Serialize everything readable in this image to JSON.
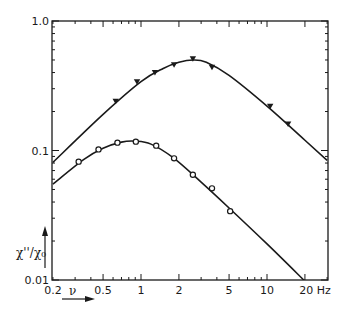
{
  "chart_data": {
    "type": "line",
    "title": "",
    "xlabel": "ν",
    "xunit": "Hz",
    "ylabel": "χ''/χ₀",
    "xscale": "log",
    "yscale": "log",
    "xlim": [
      0.2,
      30
    ],
    "ylim": [
      0.01,
      1.0
    ],
    "grid": false,
    "legend": null,
    "x_ticks": [
      {
        "value": 0.2,
        "label": "0.2"
      },
      {
        "value": 0.5,
        "label": "0.5"
      },
      {
        "value": 1,
        "label": "1"
      },
      {
        "value": 2,
        "label": "2"
      },
      {
        "value": 5,
        "label": "5"
      },
      {
        "value": 10,
        "label": "10"
      },
      {
        "value": 20,
        "label": "20 Hz"
      }
    ],
    "y_ticks": [
      {
        "value": 0.01,
        "label": "0.01"
      },
      {
        "value": 0.1,
        "label": "0.1"
      },
      {
        "value": 1.0,
        "label": "1.0"
      }
    ],
    "series": [
      {
        "name": "upper (filled triangles)",
        "marker": "filled-triangle-down",
        "points": [
          {
            "x": 0.63,
            "y": 0.24
          },
          {
            "x": 0.93,
            "y": 0.34
          },
          {
            "x": 1.29,
            "y": 0.4
          },
          {
            "x": 1.83,
            "y": 0.46
          },
          {
            "x": 2.58,
            "y": 0.51
          },
          {
            "x": 3.66,
            "y": 0.44
          },
          {
            "x": 10.6,
            "y": 0.22
          },
          {
            "x": 14.7,
            "y": 0.16
          }
        ],
        "fit_curve": [
          {
            "x": 0.2,
            "y": 0.081
          },
          {
            "x": 0.5,
            "y": 0.19
          },
          {
            "x": 1.0,
            "y": 0.34
          },
          {
            "x": 1.5,
            "y": 0.43
          },
          {
            "x": 2.0,
            "y": 0.48
          },
          {
            "x": 2.6,
            "y": 0.5
          },
          {
            "x": 3.3,
            "y": 0.48
          },
          {
            "x": 5.0,
            "y": 0.38
          },
          {
            "x": 10,
            "y": 0.22
          },
          {
            "x": 20,
            "y": 0.12
          },
          {
            "x": 30,
            "y": 0.084
          }
        ]
      },
      {
        "name": "lower (open circles)",
        "marker": "open-circle",
        "points": [
          {
            "x": 0.32,
            "y": 0.082
          },
          {
            "x": 0.46,
            "y": 0.102
          },
          {
            "x": 0.65,
            "y": 0.115
          },
          {
            "x": 0.91,
            "y": 0.117
          },
          {
            "x": 1.32,
            "y": 0.109
          },
          {
            "x": 1.83,
            "y": 0.087
          },
          {
            "x": 2.58,
            "y": 0.065
          },
          {
            "x": 3.66,
            "y": 0.051
          },
          {
            "x": 5.1,
            "y": 0.034
          }
        ],
        "fit_curve": [
          {
            "x": 0.2,
            "y": 0.055
          },
          {
            "x": 0.35,
            "y": 0.085
          },
          {
            "x": 0.5,
            "y": 0.104
          },
          {
            "x": 0.7,
            "y": 0.116
          },
          {
            "x": 0.9,
            "y": 0.118
          },
          {
            "x": 1.2,
            "y": 0.112
          },
          {
            "x": 1.8,
            "y": 0.088
          },
          {
            "x": 3.0,
            "y": 0.057
          },
          {
            "x": 5.0,
            "y": 0.036
          },
          {
            "x": 10,
            "y": 0.019
          },
          {
            "x": 20,
            "y": 0.0098
          }
        ]
      }
    ]
  },
  "labels": {
    "y_axis": "χ''/χ₀",
    "x_axis": "ν",
    "x_unit": "Hz"
  }
}
